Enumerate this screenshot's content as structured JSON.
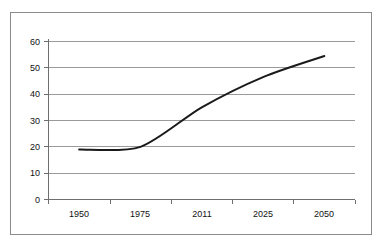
{
  "chart_data": {
    "type": "line",
    "title": "",
    "subtitle": "",
    "xlabel": "",
    "ylabel": "",
    "categories": [
      "1950",
      "1975",
      "2011",
      "2025",
      "2050"
    ],
    "values": [
      19,
      20,
      35,
      46.5,
      54.5
    ],
    "series": [
      {
        "name": "series-1",
        "values": [
          19,
          20,
          35,
          46.5,
          54.5
        ],
        "color": "#1a1a1a"
      }
    ],
    "ylim": [
      0,
      60
    ],
    "y_ticks": [
      0,
      10,
      20,
      30,
      40,
      50,
      60
    ],
    "y_tick_labels": [
      "0",
      "10",
      "20",
      "30",
      "40",
      "50",
      "60"
    ],
    "x_tick_labels": [
      "1950",
      "1975",
      "2011",
      "2025",
      "2050"
    ],
    "grid": {
      "horizontal": true,
      "vertical": false,
      "color": "#9a9a9a"
    },
    "legend": {
      "visible": false,
      "position": "none",
      "entries": []
    },
    "annotations": [],
    "markers": false,
    "smooth": true
  },
  "style": {
    "line_color": "#1a1a1a",
    "grid_color": "#9a9a9a",
    "axis_color": "#6e6e6e",
    "frame_color": "#8b8b8b",
    "text_color": "#111111",
    "background": "#ffffff"
  }
}
